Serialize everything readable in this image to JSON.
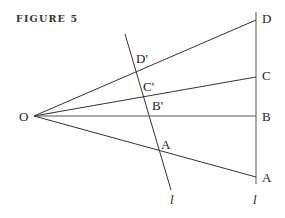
{
  "figure": {
    "title": "FIGURE 5",
    "origin_label": "O",
    "right_line_labels": [
      "D",
      "C",
      "B",
      "A"
    ],
    "slanted_line_labels": [
      "D'",
      "C'",
      "B'",
      "A"
    ],
    "line_labels": [
      "l",
      "l"
    ]
  },
  "colors": {
    "line": "#333333",
    "text": "#222222",
    "background": "#ffffff"
  }
}
